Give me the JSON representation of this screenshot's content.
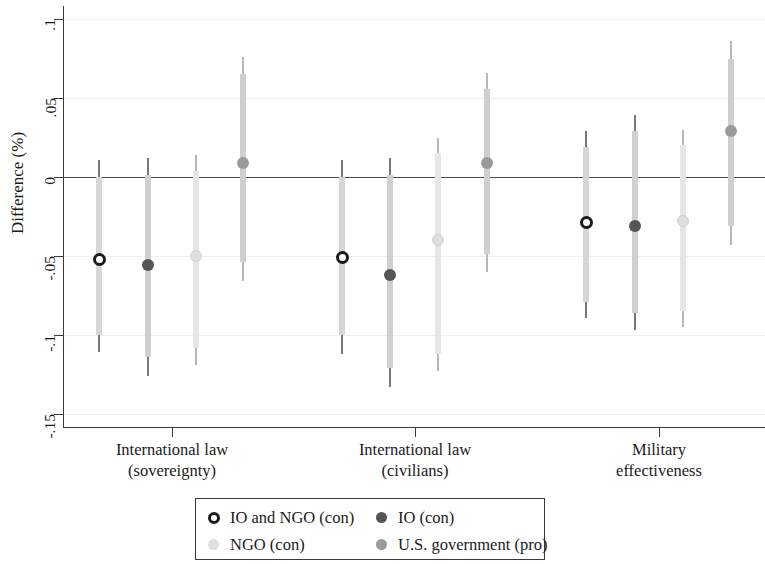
{
  "chart_data": {
    "type": "scatter",
    "title": "",
    "xlabel": "",
    "ylabel": "Difference (%)",
    "ylim": [
      -0.15,
      0.1
    ],
    "yticks": [
      0.1,
      0.05,
      0,
      -0.05,
      -0.1,
      -0.15
    ],
    "ytick_labels": [
      ".1",
      ".05",
      "0",
      "-.05",
      "-.1",
      "-.15"
    ],
    "grid": true,
    "zero_reference_line": 0,
    "legend_position": "bottom",
    "categories": [
      "International law\n(sovereignty)",
      "International law\n(civilians)",
      "Military\neffectiveness"
    ],
    "category_lines": [
      [
        "International law",
        "(sovereignty)"
      ],
      [
        "International law",
        "(civilians)"
      ],
      [
        "Military",
        "effectiveness"
      ]
    ],
    "series": [
      {
        "name": "IO and NGO (con)",
        "color": "#1a1a1a",
        "marker": "open-circle",
        "values": [
          -0.052,
          -0.051,
          -0.029
        ],
        "ci_low": [
          -0.111,
          -0.112,
          -0.089
        ],
        "ci_high": [
          0.011,
          0.011,
          0.029
        ],
        "ci90_low": [
          -0.1,
          -0.1,
          -0.079
        ],
        "ci90_high": [
          0.0,
          0.0,
          0.019
        ]
      },
      {
        "name": "IO (con)",
        "color": "#555555",
        "marker": "filled-circle",
        "values": [
          -0.056,
          -0.062,
          -0.031
        ],
        "ci_low": [
          -0.126,
          -0.133,
          -0.097
        ],
        "ci_high": [
          0.012,
          0.012,
          0.039
        ],
        "ci90_low": [
          -0.114,
          -0.121,
          -0.086
        ],
        "ci90_high": [
          0.001,
          0.001,
          0.029
        ]
      },
      {
        "name": "NGO (con)",
        "color": "#e0e0e0",
        "marker": "filled-circle",
        "values": [
          -0.05,
          -0.04,
          -0.028
        ],
        "ci_low": [
          -0.119,
          -0.123,
          -0.095
        ],
        "ci_high": [
          0.014,
          0.025,
          0.03
        ],
        "ci90_low": [
          -0.108,
          -0.112,
          -0.085
        ],
        "ci90_high": [
          0.004,
          0.015,
          0.02
        ]
      },
      {
        "name": "U.S. government (pro)",
        "color": "#9a9a9a",
        "marker": "filled-circle",
        "values": [
          0.009,
          0.009,
          0.029
        ],
        "ci_low": [
          -0.066,
          -0.06,
          -0.043
        ],
        "ci_high": [
          0.076,
          0.066,
          0.086
        ],
        "ci90_low": [
          -0.054,
          -0.049,
          -0.031
        ],
        "ci90_high": [
          0.065,
          0.056,
          0.075
        ]
      }
    ],
    "series_x_positions": [
      [
        99,
        148,
        196,
        243
      ],
      [
        342,
        390,
        438,
        487
      ],
      [
        586,
        635,
        683,
        731
      ]
    ],
    "category_tick_x": [
      172,
      415,
      659
    ]
  },
  "legend": {
    "entries": [
      {
        "label": "IO and NGO (con)",
        "color": "#1a1a1a",
        "marker": "open-circle"
      },
      {
        "label": "IO (con)",
        "color": "#555555",
        "marker": "filled-circle"
      },
      {
        "label": "NGO (con)",
        "color": "#e0e0e0",
        "marker": "filled-circle"
      },
      {
        "label": "U.S. government (pro)",
        "color": "#9a9a9a",
        "marker": "filled-circle"
      }
    ]
  }
}
